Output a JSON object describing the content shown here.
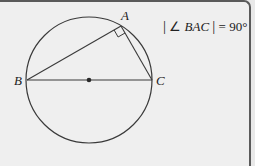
{
  "diagram": {
    "points": {
      "A": {
        "label": "A",
        "x": 121,
        "y": 26
      },
      "B": {
        "label": "B",
        "x": 27,
        "y": 80
      },
      "C": {
        "label": "C",
        "x": 152,
        "y": 80
      },
      "O": {
        "x": 89,
        "y": 80
      }
    },
    "circle": {
      "cx": 89,
      "cy": 80,
      "r": 63
    },
    "annotation": {
      "bar_left": "|",
      "angle_symbol": "∠",
      "angle_name": "BAC",
      "bar_right": "|",
      "equals": "= 90°"
    },
    "colors": {
      "stroke": "#333333",
      "background": "#efefef",
      "border": "#5a5a5a"
    }
  }
}
